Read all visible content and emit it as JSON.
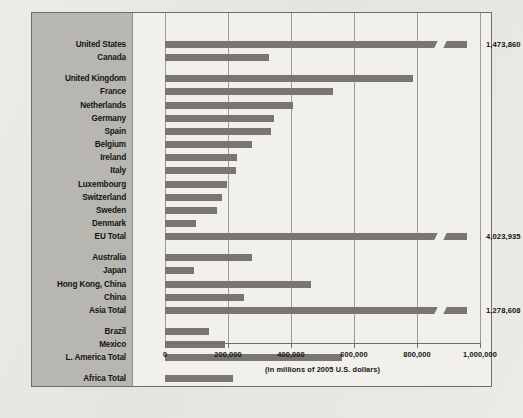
{
  "chart_data": {
    "type": "bar",
    "orientation": "horizontal",
    "title": "",
    "xlabel": "(in millions of 2005 U.S. dollars)",
    "ylabel": "",
    "xlim": [
      0,
      1000000
    ],
    "xticks": [
      0,
      200000,
      400000,
      600000,
      800000,
      1000000
    ],
    "xtick_labels": [
      "0",
      "200,000",
      "400,000",
      "600,000",
      "800,000",
      "1,000,000"
    ],
    "grid": true,
    "legend": "none",
    "axis_break_note": "Bars for United States, EU Total and Asia Total are broken; their true values exceed the axis maximum and are printed at the right.",
    "groups": [
      {
        "name": "North America",
        "items": [
          {
            "label": "United States",
            "value": 1473860,
            "display_value": "1,473,860",
            "plotted": 960000,
            "broken": true
          },
          {
            "label": "Canada",
            "value": 330000,
            "display_value": "",
            "plotted": 330000,
            "broken": false
          }
        ]
      },
      {
        "name": "Europe",
        "items": [
          {
            "label": "United Kingdom",
            "value": 787000,
            "display_value": "",
            "plotted": 787000,
            "broken": false
          },
          {
            "label": "France",
            "value": 533000,
            "display_value": "",
            "plotted": 533000,
            "broken": false
          },
          {
            "label": "Netherlands",
            "value": 406000,
            "display_value": "",
            "plotted": 406000,
            "broken": false
          },
          {
            "label": "Germany",
            "value": 345000,
            "display_value": "",
            "plotted": 345000,
            "broken": false
          },
          {
            "label": "Spain",
            "value": 338000,
            "display_value": "",
            "plotted": 338000,
            "broken": false
          },
          {
            "label": "Belgium",
            "value": 276000,
            "display_value": "",
            "plotted": 276000,
            "broken": false
          },
          {
            "label": "Ireland",
            "value": 229000,
            "display_value": "",
            "plotted": 229000,
            "broken": false
          },
          {
            "label": "Italy",
            "value": 224000,
            "display_value": "",
            "plotted": 224000,
            "broken": false
          },
          {
            "label": "Luxembourg",
            "value": 198000,
            "display_value": "",
            "plotted": 198000,
            "broken": false
          },
          {
            "label": "Switzerland",
            "value": 180000,
            "display_value": "",
            "plotted": 180000,
            "broken": false
          },
          {
            "label": "Sweden",
            "value": 166000,
            "display_value": "",
            "plotted": 166000,
            "broken": false
          },
          {
            "label": "Denmark",
            "value": 97000,
            "display_value": "",
            "plotted": 97000,
            "broken": false
          },
          {
            "label": "EU Total",
            "value": 4023935,
            "display_value": "4,023,935",
            "plotted": 960000,
            "broken": true
          }
        ]
      },
      {
        "name": "Asia-Pacific",
        "items": [
          {
            "label": "Australia",
            "value": 277000,
            "display_value": "",
            "plotted": 277000,
            "broken": false
          },
          {
            "label": "Japan",
            "value": 92000,
            "display_value": "",
            "plotted": 92000,
            "broken": false
          },
          {
            "label": "Hong Kong, China",
            "value": 464000,
            "display_value": "",
            "plotted": 464000,
            "broken": false
          },
          {
            "label": "China",
            "value": 251000,
            "display_value": "",
            "plotted": 251000,
            "broken": false
          },
          {
            "label": "Asia Total",
            "value": 1278608,
            "display_value": "1,278,608",
            "plotted": 960000,
            "broken": true
          }
        ]
      },
      {
        "name": "Latin America",
        "items": [
          {
            "label": "Brazil",
            "value": 140000,
            "display_value": "",
            "plotted": 140000,
            "broken": false
          },
          {
            "label": "Mexico",
            "value": 190000,
            "display_value": "",
            "plotted": 190000,
            "broken": false
          },
          {
            "label": "L. America Total",
            "value": 561000,
            "display_value": "",
            "plotted": 561000,
            "broken": false
          }
        ]
      },
      {
        "name": "Africa",
        "items": [
          {
            "label": "Africa Total",
            "value": 216000,
            "display_value": "",
            "plotted": 216000,
            "broken": false
          }
        ]
      }
    ]
  },
  "ghost_text": [
    {
      "text": "o the United States",
      "x": 188,
      "y": 66,
      "size": 11
    },
    {
      "text": "artnership to Reduce",
      "x": 172,
      "y": 84,
      "size": 11
    },
    {
      "text": "icy and Protect our",
      "x": 196,
      "y": 102,
      "size": 11
    },
    {
      "text": "ns and the environment",
      "x": 150,
      "y": 120,
      "size": 11
    },
    {
      "text": "global prosperity",
      "x": 206,
      "y": 138,
      "size": 11
    },
    {
      "text": "n the world economy",
      "x": 180,
      "y": 156,
      "size": 11
    },
    {
      "text": "rade and investment",
      "x": 190,
      "y": 240,
      "size": 11
    },
    {
      "text": "nd the environment",
      "x": 200,
      "y": 258,
      "size": 11
    },
    {
      "text": "r the future",
      "x": 240,
      "y": 276,
      "size": 11
    },
    {
      "text": "growth",
      "x": 265,
      "y": 318,
      "size": 11
    }
  ],
  "geometry": {
    "plot_x0": 32,
    "plot_x_per_unit": 0.000315,
    "row_top": 28,
    "row_pitch": 13.15,
    "bar_height": 7,
    "group_gap": 8
  }
}
